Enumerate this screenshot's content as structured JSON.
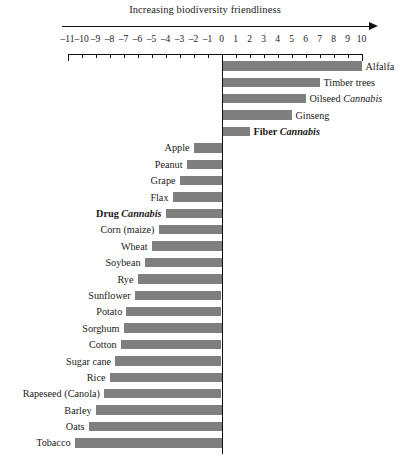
{
  "header": {
    "title": "Increasing biodiversity friendliness",
    "arrow_icon": "right-arrow-icon"
  },
  "axis": {
    "ticks": [
      -11,
      -10,
      -9,
      -8,
      -7,
      -6,
      -5,
      -4,
      -3,
      -2,
      -1,
      0,
      1,
      2,
      3,
      4,
      5,
      6,
      7,
      8,
      9,
      10
    ],
    "tick_labels": [
      "-11",
      "-10",
      "-9",
      "-8",
      "-7",
      "-6",
      "-5",
      "-4",
      "-3",
      "-2",
      "-1",
      "0",
      "1",
      "2",
      "3",
      "4",
      "5",
      "6",
      "7",
      "8",
      "9",
      "10"
    ],
    "min": -11,
    "max": 10,
    "zero": 0
  },
  "chart_data": {
    "type": "bar",
    "orientation": "horizontal",
    "title": "Increasing biodiversity friendliness",
    "xlabel": "",
    "ylabel": "",
    "xlim": [
      -11,
      10
    ],
    "grid": false,
    "legend": null,
    "bar_color": "#7f7f7f",
    "categories": [
      "Alfalfa",
      "Timber trees",
      "Oilseed Cannabis",
      "Ginseng",
      "Fiber Cannabis",
      "Apple",
      "Peanut",
      "Grape",
      "Flax",
      "Drug Cannabis",
      "Corn (maize)",
      "Wheat",
      "Soybean",
      "Rye",
      "Sunflower",
      "Potato",
      "Sorghum",
      "Cotton",
      "Sugar cane",
      "Rice",
      "Rapeseed (Canola)",
      "Barley",
      "Oats",
      "Tobacco"
    ],
    "values": [
      10,
      7,
      6,
      5,
      2,
      -2,
      -2.5,
      -3,
      -3.5,
      -4,
      -4.5,
      -5,
      -5.5,
      -6,
      -6.2,
      -6.8,
      -7,
      -7.2,
      -7.6,
      -8,
      -8.4,
      -9,
      -9.5,
      -10.5
    ]
  },
  "bars": [
    {
      "label_parts": [
        {
          "text": "Alfalfa",
          "style": "normal"
        }
      ],
      "value": 10,
      "side": "right",
      "bold": false
    },
    {
      "label_parts": [
        {
          "text": "Timber trees",
          "style": "normal"
        }
      ],
      "value": 7,
      "side": "right",
      "bold": false
    },
    {
      "label_parts": [
        {
          "text": "Oilseed ",
          "style": "normal"
        },
        {
          "text": "Cannabis",
          "style": "italic"
        }
      ],
      "value": 6,
      "side": "right",
      "bold": false
    },
    {
      "label_parts": [
        {
          "text": "Ginseng",
          "style": "normal"
        }
      ],
      "value": 5,
      "side": "right",
      "bold": false
    },
    {
      "label_parts": [
        {
          "text": "Fiber ",
          "style": "normal"
        },
        {
          "text": "Cannabis",
          "style": "italic"
        }
      ],
      "value": 2,
      "side": "right",
      "bold": true
    },
    {
      "label_parts": [
        {
          "text": "Apple",
          "style": "normal"
        }
      ],
      "value": -2,
      "side": "left",
      "bold": false
    },
    {
      "label_parts": [
        {
          "text": "Peanut",
          "style": "normal"
        }
      ],
      "value": -2.5,
      "side": "left",
      "bold": false
    },
    {
      "label_parts": [
        {
          "text": "Grape",
          "style": "normal"
        }
      ],
      "value": -3,
      "side": "left",
      "bold": false
    },
    {
      "label_parts": [
        {
          "text": "Flax",
          "style": "normal"
        }
      ],
      "value": -3.5,
      "side": "left",
      "bold": false
    },
    {
      "label_parts": [
        {
          "text": "Drug ",
          "style": "normal"
        },
        {
          "text": "Cannabis",
          "style": "italic"
        }
      ],
      "value": -4,
      "side": "left",
      "bold": true
    },
    {
      "label_parts": [
        {
          "text": "Corn (maize)",
          "style": "normal"
        }
      ],
      "value": -4.5,
      "side": "left",
      "bold": false
    },
    {
      "label_parts": [
        {
          "text": "Wheat",
          "style": "normal"
        }
      ],
      "value": -5,
      "side": "left",
      "bold": false
    },
    {
      "label_parts": [
        {
          "text": "Soybean",
          "style": "normal"
        }
      ],
      "value": -5.5,
      "side": "left",
      "bold": false
    },
    {
      "label_parts": [
        {
          "text": "Rye",
          "style": "normal"
        }
      ],
      "value": -6,
      "side": "left",
      "bold": false
    },
    {
      "label_parts": [
        {
          "text": "Sunflower",
          "style": "normal"
        }
      ],
      "value": -6.2,
      "side": "left",
      "bold": false
    },
    {
      "label_parts": [
        {
          "text": "Potato",
          "style": "normal"
        }
      ],
      "value": -6.8,
      "side": "left",
      "bold": false
    },
    {
      "label_parts": [
        {
          "text": "Sorghum",
          "style": "normal"
        }
      ],
      "value": -7,
      "side": "left",
      "bold": false
    },
    {
      "label_parts": [
        {
          "text": "Cotton",
          "style": "normal"
        }
      ],
      "value": -7.2,
      "side": "left",
      "bold": false
    },
    {
      "label_parts": [
        {
          "text": "Sugar cane",
          "style": "normal"
        }
      ],
      "value": -7.6,
      "side": "left",
      "bold": false
    },
    {
      "label_parts": [
        {
          "text": "Rice",
          "style": "normal"
        }
      ],
      "value": -8,
      "side": "left",
      "bold": false
    },
    {
      "label_parts": [
        {
          "text": "Rapeseed (Canola)",
          "style": "normal"
        }
      ],
      "value": -8.4,
      "side": "left",
      "bold": false
    },
    {
      "label_parts": [
        {
          "text": "Barley",
          "style": "normal"
        }
      ],
      "value": -9,
      "side": "left",
      "bold": false
    },
    {
      "label_parts": [
        {
          "text": "Oats",
          "style": "normal"
        }
      ],
      "value": -9.5,
      "side": "left",
      "bold": false
    },
    {
      "label_parts": [
        {
          "text": "Tobacco",
          "style": "normal"
        }
      ],
      "value": -10.5,
      "side": "left",
      "bold": false
    }
  ]
}
